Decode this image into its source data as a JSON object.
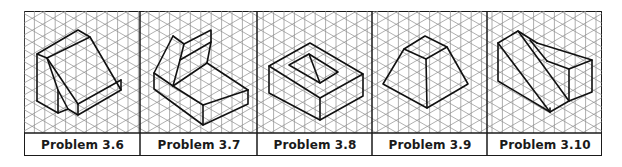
{
  "figure": {
    "colors": {
      "grid_line": "#8c8c8c",
      "border": "#1a1a1a",
      "shape_stroke": "#111111",
      "background": "#ffffff"
    },
    "grid_type": "isometric",
    "panels": [
      {
        "caption": "Problem 3.6",
        "shape": "wedge-block"
      },
      {
        "caption": "Problem 3.7",
        "shape": "stepped-block"
      },
      {
        "caption": "Problem 3.8",
        "shape": "block-with-pocket"
      },
      {
        "caption": "Problem 3.9",
        "shape": "frustum"
      },
      {
        "caption": "Problem 3.10",
        "shape": "angled-block"
      }
    ]
  }
}
